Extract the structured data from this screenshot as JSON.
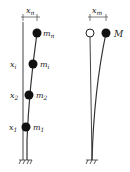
{
  "left_figure": {
    "top_dim_label": "x",
    "top_dim_sub": "n",
    "masses": [
      {
        "label": "m",
        "sub": "n",
        "disp_label": "",
        "disp_sub": ""
      },
      {
        "label": "m",
        "sub": "i",
        "disp_label": "x",
        "disp_sub": "i"
      },
      {
        "label": "m",
        "sub": "2",
        "disp_label": "x",
        "disp_sub": "2"
      },
      {
        "label": "m",
        "sub": "1",
        "disp_label": "x",
        "disp_sub": "1"
      }
    ]
  },
  "right_figure": {
    "top_dim_label": "x",
    "top_dim_sub": "m",
    "mass_label": "M"
  },
  "colors": {
    "line": "#333333",
    "mass": "#111111"
  }
}
